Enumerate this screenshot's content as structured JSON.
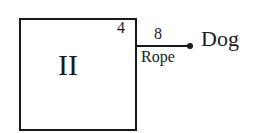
{
  "diagram": {
    "room": {
      "label": "II",
      "side_length": "4"
    },
    "rope": {
      "length": "8",
      "label": "Rope"
    },
    "animal": {
      "label": "Dog"
    }
  }
}
